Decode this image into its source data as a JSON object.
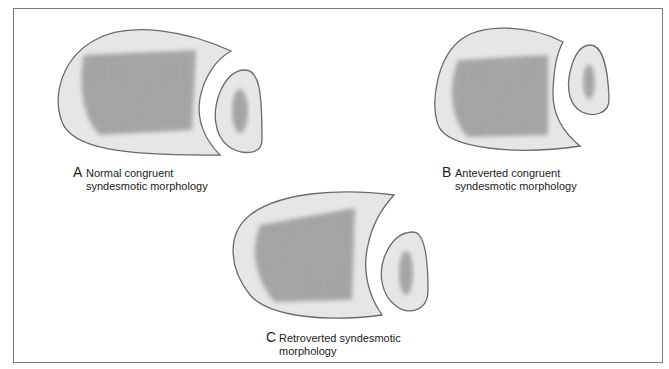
{
  "figure": {
    "panels": [
      {
        "letter": "A",
        "line1": "Normal congruent",
        "line2": "syndesmotic morphology"
      },
      {
        "letter": "B",
        "line1": "Anteverted congruent",
        "line2": "syndesmotic morphology"
      },
      {
        "letter": "C",
        "line1": "Retroverted syndesmotic",
        "line2": "morphology"
      }
    ],
    "colors": {
      "bone_fill": "#e6e6e6",
      "outline": "#6a6a6a",
      "cancellous": "#9a9a9a",
      "frame": "#7a7a7a"
    }
  }
}
